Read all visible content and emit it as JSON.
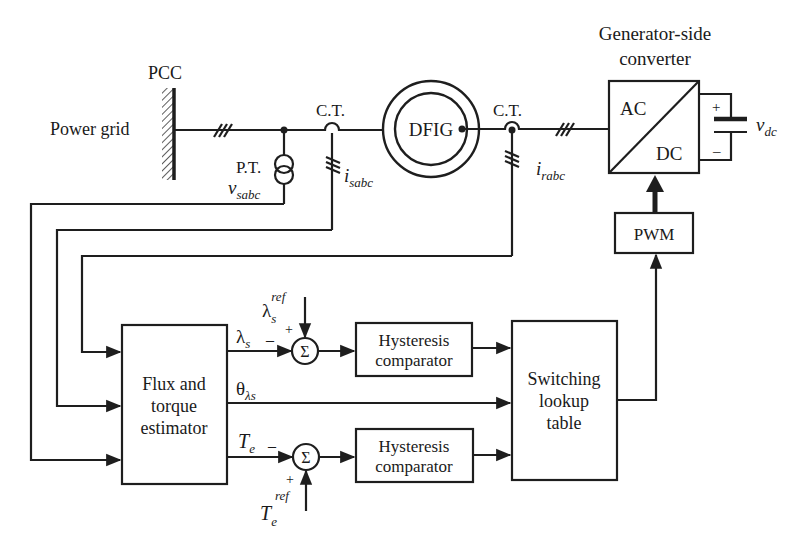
{
  "diagram": {
    "labels": {
      "pcc": "PCC",
      "power_grid": "Power grid",
      "pt": "P.T.",
      "ct1": "C.T.",
      "ct2": "C.T.",
      "dfig": "DFIG",
      "gen_side_line1": "Generator-side",
      "gen_side_line2": "converter",
      "ac": "AC",
      "dc": "DC",
      "cap_plus": "+",
      "cap_minus": "–",
      "pwm": "PWM",
      "flux_line1": "Flux and",
      "flux_line2": "torque",
      "flux_line3": "estimator",
      "hyst1_line1": "Hysteresis",
      "hyst1_line2": "comparator",
      "hyst2_line1": "Hysteresis",
      "hyst2_line2": "comparator",
      "switch_line1": "Switching",
      "switch_line2": "lookup",
      "switch_line3": "table",
      "sigma": "Σ",
      "plus": "+",
      "minus": "–"
    },
    "signals": {
      "v_sabc": {
        "base": "v",
        "sub": "sabc"
      },
      "i_sabc": {
        "base": "i",
        "sub": "sabc"
      },
      "i_rabc": {
        "base": "i",
        "sub": "rabc"
      },
      "v_dc": {
        "base": "v",
        "sub": "dc"
      },
      "lambda_s": {
        "base": "λ",
        "sub": "s"
      },
      "lambda_s_ref": {
        "base": "λ",
        "sub": "s",
        "sup": "ref"
      },
      "theta_lambda_s": {
        "base": "θ",
        "sub": "λs"
      },
      "T_e": {
        "base": "T",
        "sub": "e"
      },
      "T_e_ref": {
        "base": "T",
        "sub": "e",
        "sup": "ref"
      }
    },
    "colors": {
      "line": "#1e1e1e",
      "background": "#ffffff",
      "text": "#1a1a1a"
    }
  }
}
